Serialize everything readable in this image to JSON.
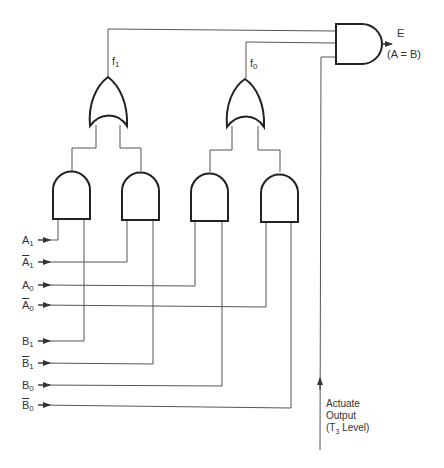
{
  "diagram": {
    "type": "logic-circuit",
    "inputs": [
      {
        "id": "A1",
        "base": "A",
        "sub": "1",
        "complement": false,
        "y": 240
      },
      {
        "id": "A1n",
        "base": "A",
        "sub": "1",
        "complement": true,
        "y": 262
      },
      {
        "id": "A0",
        "base": "A",
        "sub": "0",
        "complement": false,
        "y": 285
      },
      {
        "id": "A0n",
        "base": "A",
        "sub": "0",
        "complement": true,
        "y": 305
      },
      {
        "id": "B1",
        "base": "B",
        "sub": "1",
        "complement": false,
        "y": 340
      },
      {
        "id": "B1n",
        "base": "B",
        "sub": "1",
        "complement": true,
        "y": 362
      },
      {
        "id": "B0",
        "base": "B",
        "sub": "0",
        "complement": false,
        "y": 384
      },
      {
        "id": "B0n",
        "base": "B",
        "sub": "0",
        "complement": true,
        "y": 405
      }
    ],
    "and_gates": [
      {
        "id": "and1",
        "inputs": [
          "A1",
          "B1"
        ]
      },
      {
        "id": "and2",
        "inputs": [
          "A1n",
          "B1n"
        ]
      },
      {
        "id": "and3",
        "inputs": [
          "A0",
          "B0"
        ]
      },
      {
        "id": "and4",
        "inputs": [
          "A0n",
          "B0n"
        ]
      }
    ],
    "or_gates": [
      {
        "id": "or1",
        "inputs": [
          "and1",
          "and2"
        ],
        "output_label": "f",
        "output_sub": "1"
      },
      {
        "id": "or0",
        "inputs": [
          "and3",
          "and4"
        ],
        "output_label": "f",
        "output_sub": "0"
      }
    ],
    "output_gate": {
      "id": "andE",
      "inputs": [
        "f1",
        "f0",
        "Actuate"
      ],
      "output_label": "E",
      "output_note": "(A = B)"
    },
    "actuate": {
      "line1": "Actuate",
      "line2": "Output",
      "line3_pre": "(T",
      "line3_sub": "3",
      "line3_post": " Level)"
    }
  },
  "labels": {
    "f1": {
      "base": "f",
      "sub": "1"
    },
    "f0": {
      "base": "f",
      "sub": "0"
    },
    "E": "E",
    "E_note": "(A = B)",
    "A1": {
      "base": "A",
      "sub": "1"
    },
    "A1n": {
      "base": "A",
      "sub": "1"
    },
    "A0": {
      "base": "A",
      "sub": "0"
    },
    "A0n": {
      "base": "A",
      "sub": "0"
    },
    "B1": {
      "base": "B",
      "sub": "1"
    },
    "B1n": {
      "base": "B",
      "sub": "1"
    },
    "B0": {
      "base": "B",
      "sub": "0"
    },
    "B0n": {
      "base": "B",
      "sub": "0"
    },
    "actuate_line1": "Actuate",
    "actuate_line2": "Output",
    "actuate_line3_pre": "(T",
    "actuate_line3_sub": "3",
    "actuate_line3_post": " Level)"
  },
  "colors": {
    "line": "#444444",
    "gate": "#222222",
    "background": "#ffffff"
  }
}
